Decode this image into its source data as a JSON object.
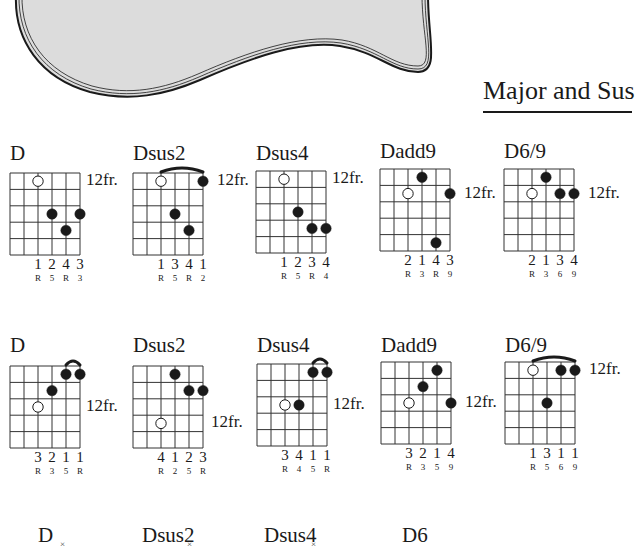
{
  "section": {
    "title": "Major and Sus"
  },
  "colors": {
    "body_fill": "#dcdcdc",
    "ink": "#1a1a1a",
    "background": "#ffffff"
  },
  "grid": {
    "strings": 6,
    "frets": 5,
    "cell_w": 14,
    "cell_h": 16.4
  },
  "rows": [
    {
      "chords": [
        {
          "name": "D",
          "x": 10,
          "name_y": 141,
          "grid_y": 173,
          "fret_label": "12fr.",
          "fret_label_row": 0,
          "fret_label_gap": 6,
          "dots": [
            {
              "s": 2,
              "f": 0,
              "open": true
            },
            {
              "s": 3,
              "f": 2
            },
            {
              "s": 5,
              "f": 2
            },
            {
              "s": 4,
              "f": 3
            }
          ],
          "barre": null,
          "fingers": [
            "1",
            "2",
            "4",
            "3"
          ],
          "degrees": [
            "R",
            "5",
            "R",
            "3"
          ]
        },
        {
          "name": "Dsus2",
          "x": 133,
          "name_y": 141,
          "grid_y": 173,
          "fret_label": "12fr.",
          "fret_label_row": 0,
          "fret_label_gap": 14,
          "dots": [
            {
              "s": 2,
              "f": 0,
              "open": true
            },
            {
              "s": 5,
              "f": 0
            },
            {
              "s": 3,
              "f": 2
            },
            {
              "s": 4,
              "f": 3
            }
          ],
          "barre": {
            "from": 2,
            "to": 5
          },
          "fingers": [
            "1",
            "3",
            "4",
            "1"
          ],
          "degrees": [
            "R",
            "5",
            "R",
            "2"
          ]
        },
        {
          "name": "Dsus4",
          "x": 256,
          "name_y": 141,
          "grid_y": 171,
          "fret_label": "12fr.",
          "fret_label_row": 0,
          "fret_label_gap": 6,
          "dots": [
            {
              "s": 2,
              "f": 0,
              "open": true
            },
            {
              "s": 3,
              "f": 2
            },
            {
              "s": 4,
              "f": 3
            },
            {
              "s": 5,
              "f": 3
            }
          ],
          "barre": null,
          "fingers": [
            "1",
            "2",
            "3",
            "4"
          ],
          "degrees": [
            "R",
            "5",
            "R",
            "4"
          ]
        },
        {
          "name": "Dadd9",
          "x": 380,
          "name_y": 139,
          "grid_y": 169,
          "fret_label": "12fr.",
          "fret_label_row": 1,
          "fret_label_gap": 14,
          "dots": [
            {
              "s": 3,
              "f": 0
            },
            {
              "s": 2,
              "f": 1,
              "open": true
            },
            {
              "s": 5,
              "f": 1
            },
            {
              "s": 4,
              "f": 4
            }
          ],
          "barre": null,
          "fingers": [
            "2",
            "1",
            "4",
            "3"
          ],
          "degrees": [
            "R",
            "3",
            "R",
            "9"
          ]
        },
        {
          "name": "D6/9",
          "x": 504,
          "name_y": 139,
          "grid_y": 169,
          "fret_label": "12fr.",
          "fret_label_row": 1,
          "fret_label_gap": 14,
          "dots": [
            {
              "s": 3,
              "f": 0
            },
            {
              "s": 2,
              "f": 1,
              "open": true
            },
            {
              "s": 4,
              "f": 1
            },
            {
              "s": 5,
              "f": 1
            }
          ],
          "barre": null,
          "fingers": [
            "2",
            "1",
            "3",
            "4"
          ],
          "degrees": [
            "R",
            "3",
            "6",
            "9"
          ]
        }
      ]
    },
    {
      "chords": [
        {
          "name": "D",
          "x": 10,
          "name_y": 333,
          "grid_y": 366,
          "fret_label": "12fr.",
          "fret_label_row": 2,
          "fret_label_gap": 6,
          "dots": [
            {
              "s": 4,
              "f": 0
            },
            {
              "s": 5,
              "f": 0
            },
            {
              "s": 3,
              "f": 1
            },
            {
              "s": 2,
              "f": 2,
              "open": true
            }
          ],
          "barre": {
            "from": 4,
            "to": 5
          },
          "fingers": [
            "3",
            "2",
            "1",
            "1"
          ],
          "degrees": [
            "R",
            "3",
            "5",
            "R"
          ]
        },
        {
          "name": "Dsus2",
          "x": 133,
          "name_y": 333,
          "grid_y": 366,
          "fret_label": "12fr.",
          "fret_label_row": 3,
          "fret_label_gap": 8,
          "dots": [
            {
              "s": 3,
              "f": 0
            },
            {
              "s": 4,
              "f": 1
            },
            {
              "s": 5,
              "f": 1
            },
            {
              "s": 2,
              "f": 3,
              "open": true
            }
          ],
          "barre": null,
          "fingers": [
            "4",
            "1",
            "2",
            "3"
          ],
          "degrees": [
            "R",
            "2",
            "5",
            "R"
          ]
        },
        {
          "name": "Dsus4",
          "x": 257,
          "name_y": 333,
          "grid_y": 364,
          "fret_label": "12fr.",
          "fret_label_row": 2,
          "fret_label_gap": 6,
          "dots": [
            {
              "s": 4,
              "f": 0
            },
            {
              "s": 5,
              "f": 0
            },
            {
              "s": 2,
              "f": 2,
              "open": true
            },
            {
              "s": 3,
              "f": 2
            }
          ],
          "barre": {
            "from": 4,
            "to": 5
          },
          "fingers": [
            "3",
            "4",
            "1",
            "1"
          ],
          "degrees": [
            "R",
            "4",
            "5",
            "R"
          ]
        },
        {
          "name": "Dadd9",
          "x": 381,
          "name_y": 333,
          "grid_y": 362,
          "fret_label": "12fr.",
          "fret_label_row": 2,
          "fret_label_gap": 14,
          "dots": [
            {
              "s": 4,
              "f": 0
            },
            {
              "s": 3,
              "f": 1
            },
            {
              "s": 2,
              "f": 2,
              "open": true
            },
            {
              "s": 5,
              "f": 2
            }
          ],
          "barre": null,
          "fingers": [
            "3",
            "2",
            "1",
            "4"
          ],
          "degrees": [
            "R",
            "3",
            "5",
            "9"
          ]
        },
        {
          "name": "D6/9",
          "x": 505,
          "name_y": 333,
          "grid_y": 362,
          "fret_label": "12fr.",
          "fret_label_row": 0,
          "fret_label_gap": 14,
          "dots": [
            {
              "s": 2,
              "f": 0,
              "open": true
            },
            {
              "s": 4,
              "f": 0
            },
            {
              "s": 5,
              "f": 0
            },
            {
              "s": 3,
              "f": 2
            }
          ],
          "barre": {
            "from": 2,
            "to": 5
          },
          "fingers": [
            "1",
            "3",
            "1",
            "1"
          ],
          "degrees": [
            "R",
            "5",
            "6",
            "9"
          ]
        }
      ]
    }
  ],
  "bottom_row": [
    {
      "name": "D",
      "x": 38,
      "y": 523
    },
    {
      "name": "Dsus2",
      "x": 142,
      "y": 523
    },
    {
      "name": "Dsus4",
      "x": 264,
      "y": 523
    },
    {
      "name": "D6",
      "x": 402,
      "y": 523
    }
  ],
  "bottom_marks": [
    {
      "label": "×",
      "x": 60
    },
    {
      "label": "×",
      "x": 187
    },
    {
      "label": "×",
      "x": 311
    }
  ]
}
